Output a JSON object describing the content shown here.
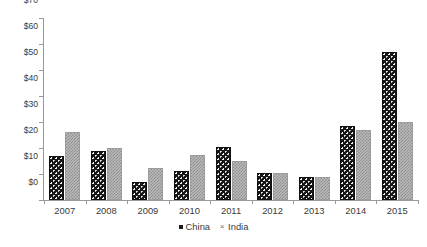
{
  "chart_data": {
    "type": "bar",
    "title": "",
    "subtitle": "",
    "xlabel": "",
    "ylabel": "",
    "categories": [
      "2007",
      "2008",
      "2009",
      "2010",
      "2011",
      "2012",
      "2013",
      "2014",
      "2015"
    ],
    "series": [
      {
        "name": "China",
        "values": [
          17,
          19,
          7,
          11,
          20.5,
          10.5,
          9,
          28.5,
          57
        ]
      },
      {
        "name": "India",
        "values": [
          26,
          20,
          12.5,
          17.5,
          15,
          10.5,
          9,
          27,
          30
        ]
      }
    ],
    "ylim": [
      0,
      70
    ],
    "yticks": [
      0,
      10,
      20,
      30,
      40,
      50,
      60,
      70
    ],
    "ytick_labels": [
      "$0",
      "$10",
      "$20",
      "$30",
      "$40",
      "$50",
      "$60",
      "$70"
    ],
    "grid": false,
    "legend_position": "bottom",
    "legend": [
      {
        "label": "China",
        "marker": "filled-square-marker",
        "color": "#1b1b1b"
      },
      {
        "label": "India",
        "marker": "cross-marker",
        "color": "#8f8f8f"
      }
    ],
    "colors": {
      "china": "#171717",
      "india": "#b9b9b9",
      "axis": "#9a9a9a",
      "text": "#3a3a3a"
    }
  }
}
